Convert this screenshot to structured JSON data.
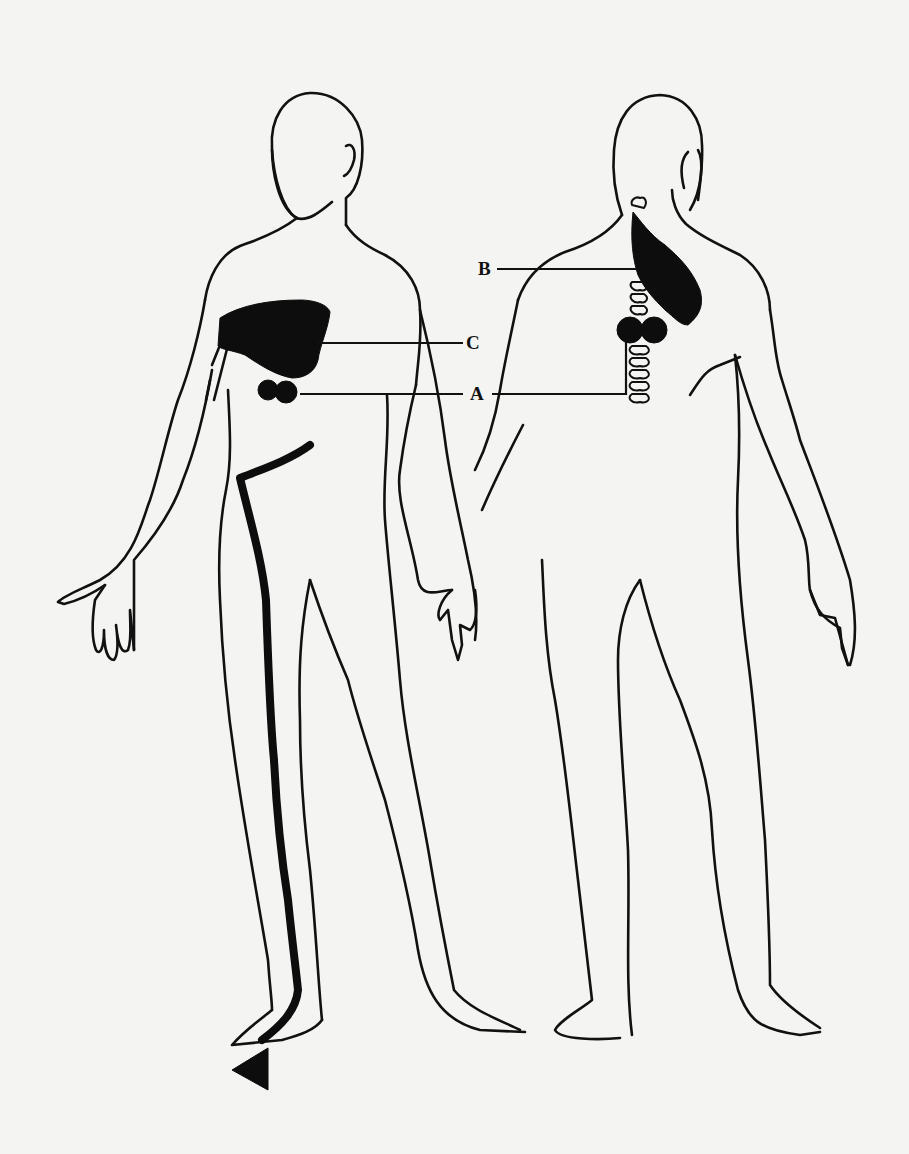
{
  "diagram": {
    "type": "anatomical pain referral illustration",
    "views": [
      "front-view",
      "back-view"
    ],
    "labels": {
      "A": "A",
      "B": "B",
      "C": "C"
    },
    "markers": [
      {
        "id": "A",
        "description": "paired dots on lower chest (front) and paired dots beside thoracic spine (back)"
      },
      {
        "id": "B",
        "description": "shaded region from neck down over trapezius (back)"
      },
      {
        "id": "C",
        "description": "shaded region over upper chest / shoulder (front)"
      }
    ],
    "extra": {
      "referral_line": "thick line from waist down the leg ending in an arrowhead at the foot"
    },
    "colors": {
      "ink": "#111111",
      "paper": "#f4f4f2"
    }
  }
}
